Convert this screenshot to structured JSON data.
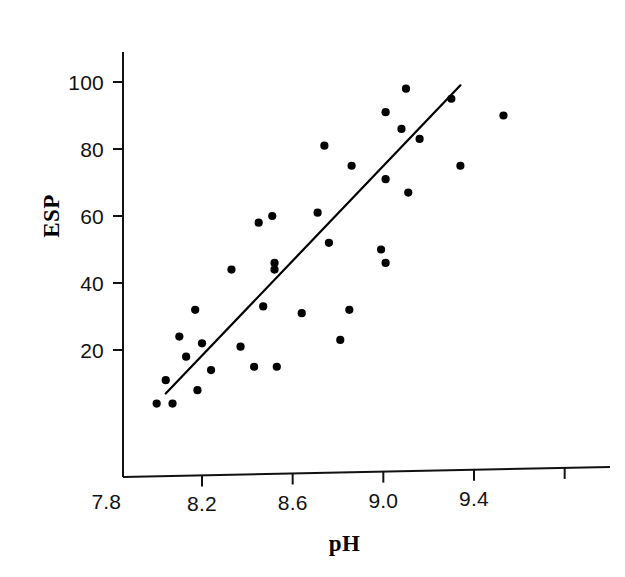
{
  "chart_data": {
    "type": "scatter",
    "title": "",
    "subtitle": "",
    "xlabel": "pH",
    "ylabel": "ESP",
    "xlim": [
      7.78,
      9.62
    ],
    "ylim": [
      0,
      110
    ],
    "grid": false,
    "legend": null,
    "legend_position": "none",
    "xticks": [
      7.8,
      8.2,
      8.6,
      9.0,
      9.4
    ],
    "xticklabels": [
      "7.8",
      "8.2",
      "8.6",
      "9.0",
      "9.4"
    ],
    "yticks": [
      20,
      40,
      60,
      80,
      100
    ],
    "yticklabels": [
      "20",
      "40",
      "60",
      "80",
      "100"
    ],
    "marker": "filled-circle",
    "marker_color": "#000000",
    "marker_size": 5,
    "points": [
      {
        "x": 8.0,
        "y": 4
      },
      {
        "x": 8.04,
        "y": 11
      },
      {
        "x": 8.07,
        "y": 4
      },
      {
        "x": 8.1,
        "y": 24
      },
      {
        "x": 8.13,
        "y": 18
      },
      {
        "x": 8.17,
        "y": 32
      },
      {
        "x": 8.18,
        "y": 8
      },
      {
        "x": 8.2,
        "y": 22
      },
      {
        "x": 8.24,
        "y": 14
      },
      {
        "x": 8.33,
        "y": 44
      },
      {
        "x": 8.37,
        "y": 21
      },
      {
        "x": 8.43,
        "y": 15
      },
      {
        "x": 8.45,
        "y": 58
      },
      {
        "x": 8.47,
        "y": 33
      },
      {
        "x": 8.51,
        "y": 60
      },
      {
        "x": 8.52,
        "y": 46
      },
      {
        "x": 8.52,
        "y": 44
      },
      {
        "x": 8.53,
        "y": 15
      },
      {
        "x": 8.64,
        "y": 31
      },
      {
        "x": 8.71,
        "y": 61
      },
      {
        "x": 8.74,
        "y": 81
      },
      {
        "x": 8.76,
        "y": 52
      },
      {
        "x": 8.81,
        "y": 23
      },
      {
        "x": 8.85,
        "y": 32
      },
      {
        "x": 8.86,
        "y": 75
      },
      {
        "x": 8.99,
        "y": 50
      },
      {
        "x": 9.01,
        "y": 71
      },
      {
        "x": 9.01,
        "y": 46
      },
      {
        "x": 9.01,
        "y": 91
      },
      {
        "x": 9.08,
        "y": 86
      },
      {
        "x": 9.1,
        "y": 98
      },
      {
        "x": 9.11,
        "y": 67
      },
      {
        "x": 9.16,
        "y": 83
      },
      {
        "x": 9.3,
        "y": 95
      },
      {
        "x": 9.34,
        "y": 75
      },
      {
        "x": 9.53,
        "y": 90
      }
    ],
    "fit_line": {
      "label": "",
      "color": "#000000",
      "x_start": 8.04,
      "y_start": 7,
      "x_end": 9.34,
      "y_end": 99
    }
  },
  "axes": {
    "y_title": "ESP",
    "x_title": "pH"
  }
}
